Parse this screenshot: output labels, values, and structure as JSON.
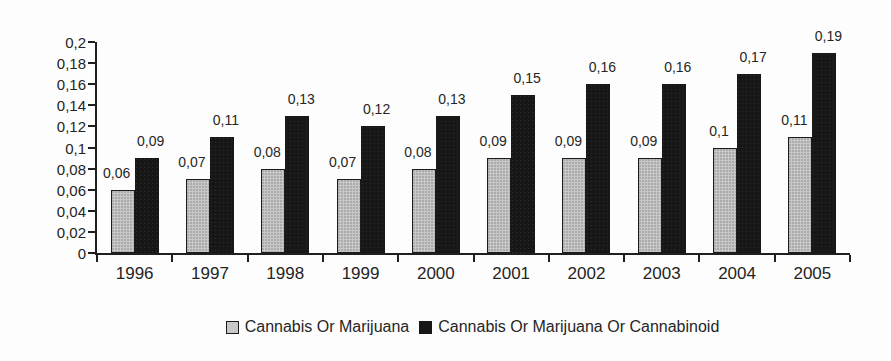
{
  "chart_data": {
    "type": "bar",
    "title": "",
    "categories": [
      "1996",
      "1997",
      "1998",
      "1999",
      "2000",
      "2001",
      "2002",
      "2003",
      "2004",
      "2005"
    ],
    "series": [
      {
        "name": "Cannabis Or Marijuana",
        "color": "#c8c8c8",
        "values": [
          0.06,
          0.07,
          0.08,
          0.07,
          0.08,
          0.09,
          0.09,
          0.09,
          0.1,
          0.11
        ],
        "value_labels": [
          "0,06",
          "0,07",
          "0,08",
          "0,07",
          "0,08",
          "0,09",
          "0,09",
          "0,09",
          "0,1",
          "0,11"
        ]
      },
      {
        "name": "Cannabis Or Marijuana Or Cannabinoid",
        "color": "#171717",
        "values": [
          0.09,
          0.11,
          0.13,
          0.12,
          0.13,
          0.15,
          0.16,
          0.16,
          0.17,
          0.19
        ],
        "value_labels": [
          "0,09",
          "0,11",
          "0,13",
          "0,12",
          "0,13",
          "0,15",
          "0,16",
          "0,16",
          "0,17",
          "0,19"
        ]
      }
    ],
    "xlabel": "",
    "ylabel": "",
    "ylim": [
      0,
      0.2
    ],
    "ytick_interval": 0.02,
    "ytick_labels": [
      "0",
      "0,02",
      "0,04",
      "0,06",
      "0,08",
      "0,1",
      "0,12",
      "0,14",
      "0,16",
      "0,18",
      "0,2"
    ],
    "grid": false,
    "legend_position": "bottom",
    "decimal_separator": ",",
    "axis_color": "#1f1f1f",
    "text_color": "#262626"
  }
}
